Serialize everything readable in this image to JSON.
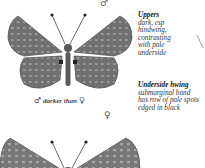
{
  "male_label": "♂",
  "female_label": "♀",
  "uppers": {
    "title": "Uppers",
    "lines": [
      "dark, esp",
      "hindwing,",
      "contrasting",
      "with pale",
      "underside"
    ]
  },
  "underside": {
    "title": "Underside hwing",
    "lines": [
      "submarginal band",
      "has row of pale spots",
      "edged in black"
    ]
  },
  "caption": {
    "male": "♂",
    "text": "darker than",
    "female": "♀"
  },
  "colors": {
    "wing": "#6f6f6f",
    "wing_dark": "#4a4a4a",
    "spot": "#9c9c9c",
    "body": "#5a5a5a"
  }
}
